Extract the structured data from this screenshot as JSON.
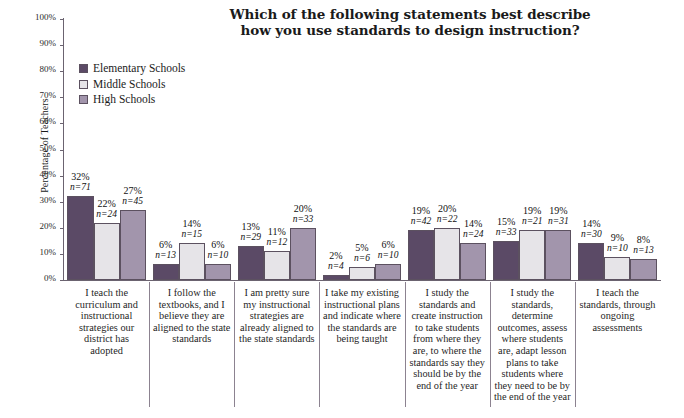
{
  "chart_data": {
    "type": "bar",
    "title": "Which of the following statements best describe how you use standards to design instruction?",
    "title_lines": [
      "Which of the following statements best describe",
      "how you use standards to design instruction?"
    ],
    "xlabel": "",
    "ylabel": "Percentage of Teachers",
    "ylim": [
      0,
      100
    ],
    "ytick_labels": [
      "100%",
      "90%",
      "80%",
      "70%",
      "60%",
      "50%",
      "40%",
      "30%",
      "20%",
      "10%",
      "0%"
    ],
    "ytick_values": [
      100,
      90,
      80,
      70,
      60,
      50,
      40,
      30,
      20,
      10,
      0
    ],
    "grid": false,
    "legend_position": "upper-left-inside",
    "categories": [
      "I teach the curriculum and instructional strategies our district has adopted",
      "I follow the textbooks, and I believe they are aligned to the state standards",
      "I am pretty sure my instructional strategies are already aligned to the state standards",
      "I take my existing instructional plans and indicate where the standards are being taught",
      "I study the standards and create instruction to take students from where they are, to where the standards say they should be by the end of the year",
      "I study the standards, determine outcomes, assess where students are, adapt lesson plans to take students where they need to be by the end of the year",
      "I teach the standards, through ongoing assessments"
    ],
    "series": [
      {
        "name": "Elementary Schools",
        "color": "#5b4a66",
        "values": [
          32,
          6,
          13,
          2,
          19,
          15,
          14
        ],
        "counts": [
          71,
          13,
          29,
          4,
          42,
          33,
          30
        ],
        "labels": [
          "32%",
          "6%",
          "13%",
          "2%",
          "19%",
          "15%",
          "14%"
        ],
        "count_labels": [
          "n=71",
          "n=13",
          "n=29",
          "n=4",
          "n=42",
          "n=33",
          "n=30"
        ]
      },
      {
        "name": "Middle Schools",
        "color": "#e6e4e8",
        "values": [
          22,
          14,
          11,
          5,
          20,
          19,
          9
        ],
        "counts": [
          24,
          15,
          12,
          6,
          22,
          21,
          10
        ],
        "labels": [
          "22%",
          "14%",
          "11%",
          "5%",
          "20%",
          "19%",
          "9%"
        ],
        "count_labels": [
          "n=24",
          "n=15",
          "n=12",
          "n=6",
          "n=22",
          "n=21",
          "n=10"
        ]
      },
      {
        "name": "High Schools",
        "color": "#a295ac",
        "values": [
          27,
          6,
          20,
          6,
          14,
          19,
          8
        ],
        "counts": [
          45,
          10,
          33,
          10,
          24,
          31,
          13
        ],
        "labels": [
          "27%",
          "6%",
          "20%",
          "6%",
          "14%",
          "19%",
          "8%"
        ],
        "count_labels": [
          "n=45",
          "n=10",
          "n=33",
          "n=10",
          "n=24",
          "n=31",
          "n=13"
        ]
      }
    ]
  }
}
